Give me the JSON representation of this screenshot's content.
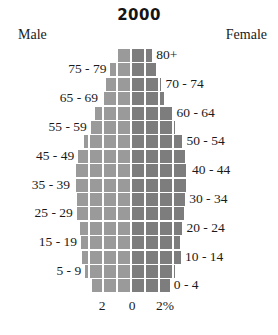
{
  "chart_data": {
    "type": "bar",
    "subtype": "population-pyramid",
    "title": "2000",
    "xlabel": "",
    "ylabel": "",
    "grid": true,
    "legend_position": "top",
    "left_series_label": "Male",
    "right_series_label": "Female",
    "xlim": [
      0,
      2
    ],
    "x_ticks": [
      {
        "label": "2",
        "value": 2,
        "side": "left"
      },
      {
        "label": "0",
        "value": 0,
        "side": "center"
      },
      {
        "label": "2%",
        "value": 2,
        "side": "right"
      }
    ],
    "colors": {
      "male": "#9a9a9a",
      "female": "#7d7d7d",
      "grid": "#ffffff",
      "background": "#ffffff",
      "text": "#1a1a1a"
    },
    "categories": [
      "80+",
      "75 - 79",
      "70 - 74",
      "65 - 69",
      "60 - 64",
      "55 - 59",
      "50 - 54",
      "45 - 49",
      "40 - 44",
      "35 - 39",
      "30 - 34",
      "25 - 29",
      "20 - 24",
      "15 - 19",
      "10 - 14",
      "5 - 9",
      "0 - 4"
    ],
    "series": [
      {
        "name": "Male",
        "values": [
          0.43,
          0.7,
          0.85,
          1.0,
          1.25,
          1.4,
          1.65,
          1.85,
          1.95,
          2.0,
          1.9,
          1.9,
          1.8,
          1.75,
          1.7,
          1.6,
          1.35
        ]
      },
      {
        "name": "Female",
        "values": [
          0.72,
          0.85,
          1.05,
          1.15,
          1.45,
          1.55,
          1.8,
          1.9,
          2.0,
          1.95,
          1.9,
          1.85,
          1.8,
          1.7,
          1.75,
          1.55,
          1.35
        ]
      }
    ],
    "rows": [
      {
        "label": "80+",
        "label_side": "right",
        "male": 0.43,
        "female": 0.72
      },
      {
        "label": "75 - 79",
        "label_side": "left",
        "male": 0.7,
        "female": 0.85
      },
      {
        "label": "70 - 74",
        "label_side": "right",
        "male": 0.85,
        "female": 1.05
      },
      {
        "label": "65 - 69",
        "label_side": "left",
        "male": 1.0,
        "female": 1.15
      },
      {
        "label": "60 - 64",
        "label_side": "right",
        "male": 1.25,
        "female": 1.45
      },
      {
        "label": "55 - 59",
        "label_side": "left",
        "male": 1.4,
        "female": 1.55
      },
      {
        "label": "50 - 54",
        "label_side": "right",
        "male": 1.65,
        "female": 1.8
      },
      {
        "label": "45 - 49",
        "label_side": "left",
        "male": 1.85,
        "female": 1.9
      },
      {
        "label": "40 - 44",
        "label_side": "right",
        "male": 1.95,
        "female": 2.0
      },
      {
        "label": "35 - 39",
        "label_side": "left",
        "male": 2.0,
        "female": 1.95
      },
      {
        "label": "30 - 34",
        "label_side": "right",
        "male": 1.9,
        "female": 1.9
      },
      {
        "label": "25 - 29",
        "label_side": "left",
        "male": 1.9,
        "female": 1.85
      },
      {
        "label": "20 - 24",
        "label_side": "right",
        "male": 1.8,
        "female": 1.8
      },
      {
        "label": "15 - 19",
        "label_side": "left",
        "male": 1.75,
        "female": 1.7
      },
      {
        "label": "10 - 14",
        "label_side": "right",
        "male": 1.7,
        "female": 1.75
      },
      {
        "label": "5 - 9",
        "label_side": "left",
        "male": 1.6,
        "female": 1.55
      },
      {
        "label": "0 - 4",
        "label_side": "right",
        "male": 1.35,
        "female": 1.35
      }
    ]
  },
  "header": {
    "title": "2000",
    "male_label": "Male",
    "female_label": "Female"
  },
  "axis": {
    "left_tick": "2",
    "center_tick": "0",
    "right_tick": "2%"
  }
}
